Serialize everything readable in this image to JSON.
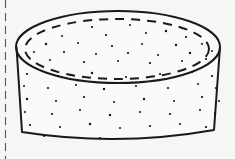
{
  "document": {
    "background_color": "#f7f6f4",
    "ink_color": "#1a1a1a",
    "width": 235,
    "height": 159
  },
  "figure": {
    "name": "cylindrical-disc-illustration",
    "style": "pen-and-ink line drawing",
    "stroke_color": "#1a1a1a",
    "fill_color": "#fbfaf8"
  },
  "margin_rule": {
    "name": "left-margin-dashed-line",
    "orientation": "vertical",
    "x": 5.5,
    "y_start": 0,
    "y_end": 159,
    "dash": "8 5",
    "stroke_width": 1.1,
    "color": "#555555"
  },
  "geometry": {
    "top_ellipse": {
      "label": "top-face-outline",
      "center_x": 118,
      "center_y": 47,
      "radius_x": 102,
      "radius_y": 36,
      "stroke_width": 2.0,
      "style": "solid"
    },
    "inner_dashed_ellipse": {
      "label": "top-face-inner-rim",
      "center_x": 117,
      "center_y": 49,
      "radius_x": 92,
      "radius_y": 30,
      "stroke_width": 2.0,
      "style": "dashed",
      "dash": "9 7"
    },
    "body": {
      "label": "cylinder-side-wall",
      "left_x_top": 16.5,
      "left_x_bottom": 22,
      "right_x_top": 220,
      "right_x_bottom": 214,
      "top_y": 47,
      "bottom_y": 132,
      "bottom_bulge_y": 147,
      "stroke_width": 2.0
    }
  },
  "speckles": {
    "label": "stipple-texture-dots",
    "color": "#111111",
    "count_top_face": 26,
    "count_side_wall": 40,
    "radius_range": [
      0.7,
      1.5
    ],
    "top_face": [
      [
        92,
        27,
        1.1
      ],
      [
        130,
        25,
        1.0
      ],
      [
        166,
        31,
        1.2
      ],
      [
        62,
        36,
        1.0
      ],
      [
        106,
        35,
        1.1
      ],
      [
        146,
        33,
        1.0
      ],
      [
        186,
        37,
        1.1
      ],
      [
        46,
        44,
        1.2
      ],
      [
        78,
        43,
        1.0
      ],
      [
        112,
        46,
        1.1
      ],
      [
        142,
        44,
        1.0
      ],
      [
        176,
        45,
        1.2
      ],
      [
        202,
        44,
        1.0
      ],
      [
        34,
        52,
        1.0
      ],
      [
        64,
        52,
        1.1
      ],
      [
        96,
        54,
        1.0
      ],
      [
        128,
        53,
        1.1
      ],
      [
        158,
        55,
        1.0
      ],
      [
        190,
        53,
        1.2
      ],
      [
        212,
        51,
        1.0
      ],
      [
        50,
        60,
        1.0
      ],
      [
        84,
        62,
        1.1
      ],
      [
        118,
        61,
        1.0
      ],
      [
        150,
        63,
        1.1
      ],
      [
        182,
        61,
        1.0
      ],
      [
        206,
        59,
        1.1
      ]
    ],
    "side_wall": [
      [
        27,
        74,
        1.1
      ],
      [
        58,
        76,
        1.0
      ],
      [
        92,
        73,
        1.2
      ],
      [
        126,
        77,
        1.0
      ],
      [
        160,
        74,
        1.1
      ],
      [
        192,
        72,
        1.0
      ],
      [
        212,
        76,
        1.1
      ],
      [
        24,
        86,
        1.0
      ],
      [
        48,
        88,
        1.1
      ],
      [
        76,
        85,
        1.0
      ],
      [
        104,
        89,
        1.2
      ],
      [
        136,
        86,
        1.0
      ],
      [
        168,
        88,
        1.1
      ],
      [
        198,
        84,
        1.0
      ],
      [
        216,
        88,
        1.1
      ],
      [
        27,
        99,
        1.2
      ],
      [
        56,
        101,
        1.0
      ],
      [
        84,
        97,
        1.1
      ],
      [
        114,
        102,
        1.0
      ],
      [
        144,
        99,
        1.2
      ],
      [
        174,
        101,
        1.0
      ],
      [
        202,
        97,
        1.1
      ],
      [
        219,
        101,
        1.0
      ],
      [
        25,
        112,
        1.0
      ],
      [
        52,
        114,
        1.1
      ],
      [
        80,
        110,
        1.0
      ],
      [
        110,
        115,
        1.2
      ],
      [
        140,
        112,
        1.0
      ],
      [
        170,
        114,
        1.1
      ],
      [
        200,
        110,
        1.0
      ],
      [
        215,
        113,
        1.1
      ],
      [
        30,
        125,
        1.1
      ],
      [
        60,
        127,
        1.0
      ],
      [
        90,
        124,
        1.2
      ],
      [
        120,
        128,
        1.0
      ],
      [
        150,
        126,
        1.1
      ],
      [
        180,
        124,
        1.0
      ],
      [
        206,
        127,
        1.1
      ],
      [
        44,
        136,
        1.0
      ],
      [
        100,
        138,
        1.1
      ]
    ]
  }
}
